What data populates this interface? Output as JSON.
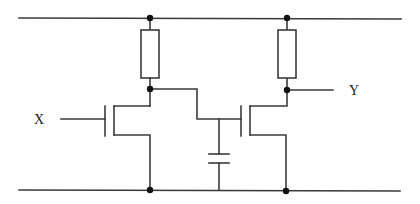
{
  "diagram": {
    "type": "circuit-schematic",
    "labels": {
      "input": "X",
      "output": "Y"
    },
    "components": [
      {
        "id": "R1",
        "kind": "resistor",
        "position": "left load"
      },
      {
        "id": "R2",
        "kind": "resistor",
        "position": "right load"
      },
      {
        "id": "M1",
        "kind": "nmos-transistor",
        "gate": "X"
      },
      {
        "id": "M2",
        "kind": "nmos-transistor",
        "gate": "intermediate node"
      },
      {
        "id": "C1",
        "kind": "capacitor",
        "position": "intermediate node to ground"
      }
    ],
    "rails": [
      "top supply rail",
      "bottom ground rail"
    ],
    "colors": {
      "line": "#3a3a3a",
      "junction": "#111111",
      "background": "#ffffff"
    }
  }
}
